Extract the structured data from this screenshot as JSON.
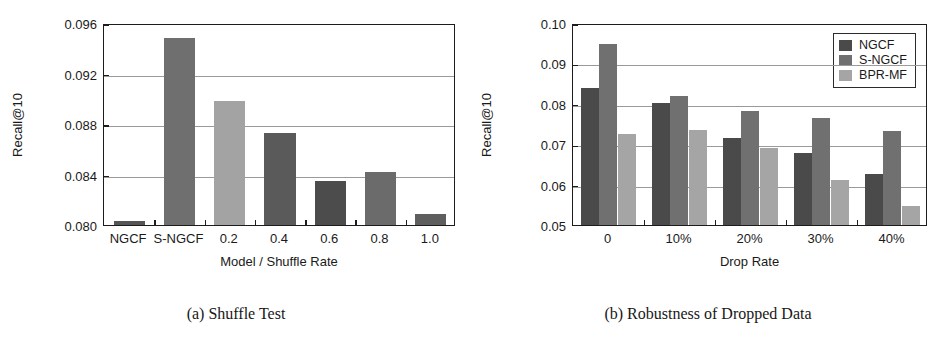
{
  "figure": {
    "panels": [
      {
        "id": "a",
        "caption": "(a) Shuffle Test",
        "chart_data": {
          "type": "bar",
          "title": "",
          "xlabel": "Model / Shuffle Rate",
          "ylabel": "Recall@10",
          "categories": [
            "NGCF",
            "S-NGCF",
            "0.2",
            "0.4",
            "0.6",
            "0.8",
            "1.0"
          ],
          "values": [
            0.0803,
            0.0948,
            0.0898,
            0.0873,
            0.0835,
            0.0842,
            0.0809
          ],
          "ylim": [
            0.08,
            0.096
          ],
          "yticks": [
            0.08,
            0.084,
            0.088,
            0.092,
            0.096
          ],
          "ytick_labels": [
            "0.080",
            "0.084",
            "0.088",
            "0.092",
            "0.096"
          ],
          "grid": true,
          "legend": null,
          "bar_colors": [
            "#555555",
            "#6f6f6f",
            "#a3a3a3",
            "#5a5a5a",
            "#4c4c4c",
            "#6b6b6b",
            "#5e5e5e"
          ]
        }
      },
      {
        "id": "b",
        "caption": "(b) Robustness of Dropped Data",
        "chart_data": {
          "type": "bar",
          "title": "",
          "xlabel": "Drop Rate",
          "ylabel": "Recall@10",
          "categories": [
            "0",
            "10%",
            "20%",
            "30%",
            "40%"
          ],
          "series": [
            {
              "name": "NGCF",
              "values": [
                0.084,
                0.0803,
                0.0716,
                0.0678,
                0.0627
              ],
              "color": "#4a4a4a"
            },
            {
              "name": "S-NGCF",
              "values": [
                0.0948,
                0.082,
                0.0783,
                0.0766,
                0.0733
              ],
              "color": "#707070"
            },
            {
              "name": "BPR-MF",
              "values": [
                0.0726,
                0.0735,
                0.0691,
                0.0612,
                0.0546
              ],
              "color": "#a5a5a5"
            }
          ],
          "ylim": [
            0.05,
            0.1
          ],
          "yticks": [
            0.05,
            0.06,
            0.07,
            0.08,
            0.09,
            0.1
          ],
          "ytick_labels": [
            "0.05",
            "0.06",
            "0.07",
            "0.08",
            "0.09",
            "0.10"
          ],
          "grid": true,
          "legend": {
            "position": "top-right",
            "entries": [
              "NGCF",
              "S-NGCF",
              "BPR-MF"
            ]
          }
        }
      }
    ]
  }
}
